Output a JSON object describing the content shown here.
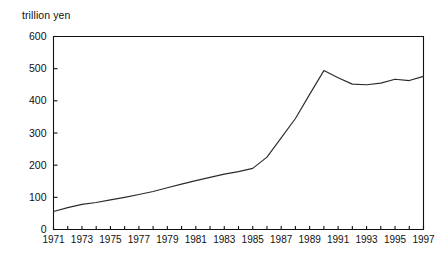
{
  "chart_data": {
    "type": "line",
    "title": "",
    "ylabel": "trillion yen",
    "xlabel": "",
    "ylim": [
      0,
      600
    ],
    "xlim": [
      1971,
      1997
    ],
    "grid": false,
    "legend": null,
    "y_ticks": [
      0,
      100,
      200,
      300,
      400,
      500,
      600
    ],
    "y_tick_labels": [
      "0",
      "100",
      "200",
      "300",
      "400",
      "500",
      "600"
    ],
    "x_ticks": [
      1971,
      1972,
      1973,
      1974,
      1975,
      1976,
      1977,
      1978,
      1979,
      1980,
      1981,
      1982,
      1983,
      1984,
      1985,
      1986,
      1987,
      1988,
      1989,
      1990,
      1991,
      1992,
      1993,
      1994,
      1995,
      1996,
      1997
    ],
    "x_tick_labels": [
      "1971",
      "",
      "1973",
      "",
      "1975",
      "",
      "1977",
      "",
      "1979",
      "",
      "1981",
      "",
      "1983",
      "",
      "1985",
      "",
      "1987",
      "",
      "1989",
      "",
      "1991",
      "",
      "1993",
      "",
      "1995",
      "",
      "1997"
    ],
    "x": [
      1971,
      1972,
      1973,
      1974,
      1975,
      1976,
      1977,
      1978,
      1979,
      1980,
      1981,
      1982,
      1983,
      1984,
      1985,
      1986,
      1987,
      1988,
      1989,
      1990,
      1991,
      1992,
      1993,
      1994,
      1995,
      1996,
      1997
    ],
    "values": [
      56,
      68,
      78,
      84,
      92,
      100,
      109,
      118,
      130,
      141,
      152,
      162,
      172,
      180,
      190,
      225,
      285,
      345,
      420,
      494,
      472,
      452,
      450,
      455,
      467,
      463,
      476
    ],
    "series": [
      {
        "name": "trillion yen",
        "color": "#2b2b2b",
        "values": [
          56,
          68,
          78,
          84,
          92,
          100,
          109,
          118,
          130,
          141,
          152,
          162,
          172,
          180,
          190,
          225,
          285,
          345,
          420,
          494,
          472,
          452,
          450,
          455,
          467,
          463,
          476
        ]
      }
    ]
  }
}
